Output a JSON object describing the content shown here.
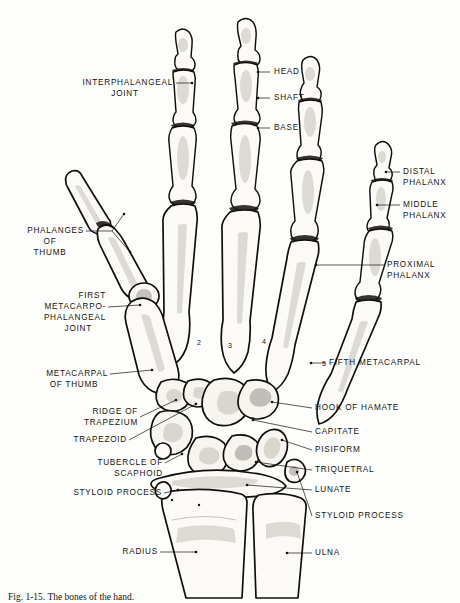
{
  "figure": {
    "background_color": "#fdfdfb",
    "ink_color": "#15130f",
    "caption": "Fig. 1-15.  The bones of the hand."
  },
  "labels_left": [
    {
      "id": "interphalangeal-joint",
      "lines": [
        "INTERPHALANGEAL",
        "JOINT"
      ]
    },
    {
      "id": "phalanges-of-thumb",
      "lines": [
        "PHALANGES",
        "OF",
        "THUMB"
      ]
    },
    {
      "id": "first-metacarpophalangeal-joint",
      "lines": [
        "FIRST",
        "METACARPO-",
        "PHALANGEAL",
        "JOINT"
      ]
    },
    {
      "id": "metacarpal-of-thumb",
      "lines": [
        "METACARPAL",
        "OF THUMB"
      ]
    },
    {
      "id": "ridge-of-trapezium",
      "lines": [
        "RIDGE OF",
        "TRAPEZIUM"
      ]
    },
    {
      "id": "trapezoid",
      "lines": [
        "TRAPEZOID"
      ]
    },
    {
      "id": "tubercle-of-scaphoid",
      "lines": [
        "TUBERCLE OF",
        "SCAPHOID"
      ]
    },
    {
      "id": "styloid-process-radial",
      "lines": [
        "STYLOID PROCESS"
      ]
    },
    {
      "id": "radius",
      "lines": [
        "RADIUS"
      ]
    }
  ],
  "labels_right": [
    {
      "id": "head",
      "lines": [
        "HEAD"
      ]
    },
    {
      "id": "shaft",
      "lines": [
        "SHAFT"
      ]
    },
    {
      "id": "base",
      "lines": [
        "BASE"
      ]
    },
    {
      "id": "distal-phalanx",
      "lines": [
        "DISTAL",
        "PHALANX"
      ]
    },
    {
      "id": "middle-phalanx",
      "lines": [
        "MIDDLE",
        "PHALANX"
      ]
    },
    {
      "id": "proximal-phalanx",
      "lines": [
        "PROXIMAL",
        "PHALANX"
      ]
    },
    {
      "id": "fifth-metacarpal",
      "lines": [
        "FIFTH METACARPAL"
      ]
    },
    {
      "id": "hook-of-hamate",
      "lines": [
        "HOOK OF HAMATE"
      ]
    },
    {
      "id": "capitate",
      "lines": [
        "CAPITATE"
      ]
    },
    {
      "id": "pisiform",
      "lines": [
        "PISIFORM"
      ]
    },
    {
      "id": "triquetral",
      "lines": [
        "TRIQUETRAL"
      ]
    },
    {
      "id": "lunate",
      "lines": [
        "LUNATE"
      ]
    },
    {
      "id": "styloid-process-ulnar",
      "lines": [
        "STYLOID PROCESS"
      ]
    },
    {
      "id": "ulna",
      "lines": [
        "ULNA"
      ]
    }
  ],
  "metacarpal_numbers": [
    "2",
    "3",
    "4",
    "5"
  ],
  "text": {
    "interphalangeal_joint_1": "INTERPHALANGEAL",
    "interphalangeal_joint_2": "JOINT",
    "phalanges_thumb_1": "PHALANGES",
    "phalanges_thumb_2": "OF",
    "phalanges_thumb_3": "THUMB",
    "first_mcp_1": "FIRST",
    "first_mcp_2": "METACARPO-",
    "first_mcp_3": "PHALANGEAL",
    "first_mcp_4": "JOINT",
    "metacarpal_thumb_1": "METACARPAL",
    "metacarpal_thumb_2": "OF THUMB",
    "ridge_trapezium_1": "RIDGE OF",
    "ridge_trapezium_2": "TRAPEZIUM",
    "trapezoid": "TRAPEZOID",
    "tubercle_scaphoid_1": "TUBERCLE OF",
    "tubercle_scaphoid_2": "SCAPHOID",
    "styloid_radial": "STYLOID PROCESS",
    "radius": "RADIUS",
    "head": "HEAD",
    "shaft": "SHAFT",
    "base": "BASE",
    "distal_phalanx_1": "DISTAL",
    "distal_phalanx_2": "PHALANX",
    "middle_phalanx_1": "MIDDLE",
    "middle_phalanx_2": "PHALANX",
    "proximal_phalanx_1": "PROXIMAL",
    "proximal_phalanx_2": "PHALANX",
    "fifth_metacarpal": "FIFTH METACARPAL",
    "hook_hamate": "HOOK OF HAMATE",
    "capitate": "CAPITATE",
    "pisiform": "PISIFORM",
    "triquetral": "TRIQUETRAL",
    "lunate": "LUNATE",
    "styloid_ulnar": "STYLOID PROCESS",
    "ulna": "ULNA",
    "num2": "2",
    "num3": "3",
    "num4": "4",
    "num5": "5",
    "caption": "Fig. 1-15.  The bones of the hand."
  }
}
